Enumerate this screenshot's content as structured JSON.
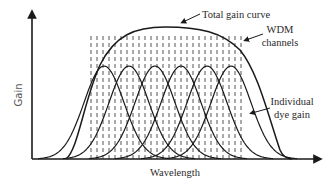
{
  "diagram": {
    "type": "gain spectrum schematic",
    "axes": {
      "x_label": "Wavelength",
      "y_label": "Gain"
    },
    "annotations": {
      "total_gain": "Total gain curve",
      "wdm_line1": "WDM",
      "wdm_line2": "channels",
      "dye_line1": "Individual",
      "dye_line2": "dye gain"
    },
    "individual_gain_peaks_x": [
      104,
      129,
      155,
      181,
      207,
      231
    ],
    "individual_gain_peak_y": 66,
    "wdm_channel_count": 26,
    "wdm_channel_range_x": [
      91,
      241
    ],
    "colors": {
      "line": "#1a1a1a",
      "dashed": "#555555",
      "background": "#ffffff"
    }
  }
}
